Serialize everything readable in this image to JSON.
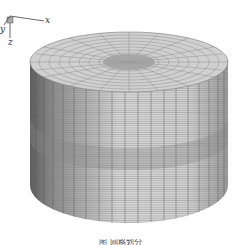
{
  "figure": {
    "type": "finite-element mesh of a cylinder",
    "axes": {
      "x_label": "x",
      "y_label": "y",
      "z_label": "z"
    },
    "caption": "图 网格划分",
    "colors": {
      "mesh_light": "#c9c9c9",
      "mesh_dark": "#555555",
      "band": "#a8a8a8",
      "background": "#ffffff"
    }
  }
}
